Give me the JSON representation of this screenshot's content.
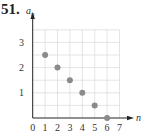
{
  "problem": {
    "number": "51."
  },
  "chart_data": {
    "type": "scatter",
    "title": "",
    "xlabel": "n",
    "ylabel": "a_n",
    "x": [
      1,
      2,
      3,
      4,
      5,
      6
    ],
    "values": [
      2.5,
      2,
      1.5,
      1,
      0.5,
      0
    ],
    "xlim": [
      0,
      7
    ],
    "ylim": [
      0,
      3.5
    ],
    "x_ticks": [
      "0",
      "1",
      "2",
      "3",
      "4",
      "5",
      "6",
      "7"
    ],
    "y_ticks": [
      "1",
      "2",
      "3"
    ],
    "grid": true,
    "grid_step_x": 1,
    "grid_step_y": 0.5,
    "point_color": "#8a8a8a",
    "grid_color": "#dddddd",
    "axis_color": "#222222"
  }
}
